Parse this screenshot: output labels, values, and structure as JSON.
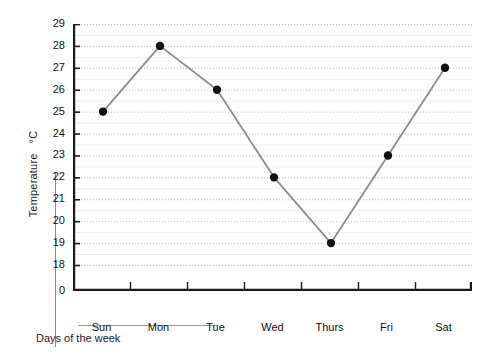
{
  "chart_data": {
    "type": "line",
    "title": "",
    "xlabel": "Days of the week",
    "ylabel": "Temperature  °C",
    "ylabel_main": "Temperature",
    "ylabel_unit": "°C",
    "categories": [
      "Sun",
      "Mon",
      "Tue",
      "Wed",
      "Thurs",
      "Fri",
      "Sat"
    ],
    "values": [
      25,
      28,
      26,
      22,
      19,
      23,
      27
    ],
    "series": [
      {
        "name": "Temperature",
        "values": [
          25,
          28,
          26,
          22,
          19,
          23,
          27
        ]
      }
    ],
    "ytick_labels": [
      "29",
      "28",
      "27",
      "26",
      "25",
      "24",
      "23",
      "22",
      "21",
      "20",
      "19",
      "18",
      "0"
    ],
    "ytick_values": [
      29,
      28,
      27,
      26,
      25,
      24,
      23,
      22,
      21,
      20,
      19,
      18,
      0
    ],
    "ylim": [
      18,
      29
    ],
    "axis_break": true,
    "axis_break_note": "0 shown at origin below 18 (broken scale)",
    "grid": true,
    "grid_style": "dotted-horizontal",
    "legend": "none",
    "line_color": "#8c8c8c",
    "marker_color": "#101010",
    "axis_color": "#1a1a1a",
    "grid_color": "#b9b9c4"
  }
}
